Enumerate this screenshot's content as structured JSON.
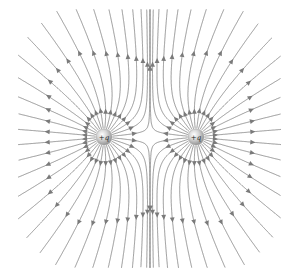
{
  "diagram": {
    "canvas": {
      "width": 299,
      "height": 276
    },
    "clip": {
      "x_min": 18,
      "x_max": 281,
      "y_min": 9,
      "y_max": 268
    },
    "colors": {
      "background": "#ffffff",
      "field_line": "#8a8a8a",
      "arrow": "#7a7a7a",
      "charge_highlight": "#ffffff",
      "charge_mid": "#d4d4d4",
      "charge_edge": "#8c8c8c"
    },
    "lines_per_charge": 32,
    "arrow_size": 3.2,
    "charges": [
      {
        "label": "+q",
        "x": 104,
        "y": 137,
        "q": 1,
        "radius": 8
      },
      {
        "label": "+q",
        "x": 196,
        "y": 137,
        "q": 1,
        "radius": 8
      }
    ],
    "field_direction": "outward"
  }
}
